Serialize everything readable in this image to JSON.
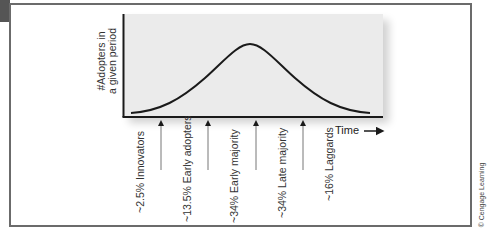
{
  "diagram": {
    "y_axis_label_line1": "#Adopters in",
    "y_axis_label_line2": "a given period",
    "x_axis_label": "Time",
    "curve_type": "bell curve",
    "categories": [
      {
        "label": "~2.5% Innovators",
        "share": "~2.5%",
        "name": "Innovators"
      },
      {
        "label": "~13.5% Early adopters",
        "share": "~13.5%",
        "name": "Early adopters"
      },
      {
        "label": "~34% Early majority",
        "share": "~34%",
        "name": "Early majority"
      },
      {
        "label": "~34% Late majority",
        "share": "~34%",
        "name": "Late majority"
      },
      {
        "label": "~16% Laggards",
        "share": "~16%",
        "name": "Laggards"
      }
    ],
    "copyright": "© Cengage Learning"
  },
  "colors": {
    "frame": "#6b6b6b",
    "tab": "#555555",
    "plot_bg": "#ebebeb",
    "curve": "#1a1a1a",
    "text": "#333333"
  }
}
